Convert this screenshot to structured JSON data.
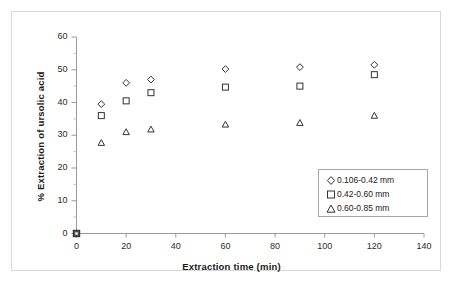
{
  "chart_data": {
    "type": "scatter",
    "title": "",
    "xlabel": "Extraction time (min)",
    "ylabel": "% Extraction of ursolic acid",
    "xlim": [
      0,
      140
    ],
    "ylim": [
      0,
      60
    ],
    "xticks": [
      0,
      20,
      40,
      60,
      80,
      100,
      120,
      140
    ],
    "yticks": [
      0,
      10,
      20,
      30,
      40,
      50,
      60
    ],
    "xtick_labels": [
      "0",
      "20",
      "40",
      "60",
      "80",
      "100",
      "120",
      "140"
    ],
    "ytick_labels": [
      "0",
      "10",
      "20",
      "30",
      "40",
      "50",
      "60"
    ],
    "grid": false,
    "legend_position": "lower right",
    "series": [
      {
        "name": "0.106-0.42 mm",
        "marker": "diamond",
        "x": [
          0,
          10,
          20,
          30,
          60,
          90,
          120
        ],
        "y": [
          0,
          39.5,
          46.0,
          47.0,
          50.2,
          50.8,
          51.5
        ]
      },
      {
        "name": "0.42-0.60 mm",
        "marker": "square",
        "x": [
          0,
          10,
          20,
          30,
          60,
          90,
          120
        ],
        "y": [
          0,
          36.0,
          40.5,
          43.0,
          44.7,
          45.0,
          48.5
        ]
      },
      {
        "name": "0.60-0.85 mm",
        "marker": "triangle",
        "x": [
          0,
          10,
          20,
          30,
          60,
          90,
          120
        ],
        "y": [
          0,
          27.7,
          31.0,
          31.8,
          33.3,
          33.8,
          36.0
        ]
      }
    ]
  },
  "axes": {
    "x_title": "Extraction time (min)",
    "y_title": "% Extraction of ursolic acid"
  },
  "legend": {
    "entries": [
      {
        "label": "0.106-0.42 mm",
        "marker": "diamond-marker-icon"
      },
      {
        "label": "0.42-0.60 mm",
        "marker": "square-marker-icon"
      },
      {
        "label": "0.60-0.85 mm",
        "marker": "triangle-marker-icon"
      }
    ]
  },
  "ticks": {
    "y": [
      "60",
      "50",
      "40",
      "30",
      "20",
      "10",
      "0"
    ],
    "x": [
      "0",
      "20",
      "40",
      "60",
      "80",
      "100",
      "120",
      "140"
    ]
  },
  "colors": {
    "marker_stroke": "#333333",
    "axis": "#808080",
    "frame": "#d9d9d9",
    "text": "#1a1a1a",
    "background": "#ffffff"
  }
}
